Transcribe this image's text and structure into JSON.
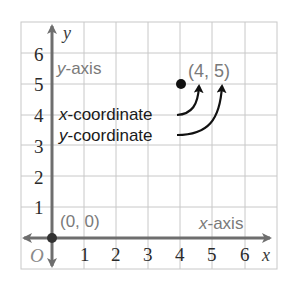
{
  "diagram": {
    "colors": {
      "grid": "#c8c8c8",
      "axis": "#6e6e6e",
      "point": "#111111",
      "label_gray": "#7a7a7a",
      "label_dark": "#1a1a1a"
    },
    "axes": {
      "x_label": "x",
      "y_label": "y",
      "origin_label": "O",
      "x_ticks": [
        "1",
        "2",
        "3",
        "4",
        "5",
        "6"
      ],
      "y_ticks": [
        "1",
        "2",
        "3",
        "4",
        "5",
        "6"
      ],
      "x_axis_name": {
        "var": "x",
        "suffix": "-axis"
      },
      "y_axis_name": {
        "var": "y",
        "suffix": "-axis"
      }
    },
    "points": [
      {
        "label": "(0, 0)",
        "x": 0,
        "y": 0
      },
      {
        "label": "(4, 5)",
        "x": 4,
        "y": 5
      }
    ],
    "annotations": [
      {
        "var": "x",
        "suffix": "-coordinate",
        "points_to": "4"
      },
      {
        "var": "y",
        "suffix": "-coordinate",
        "points_to": "5"
      }
    ]
  }
}
